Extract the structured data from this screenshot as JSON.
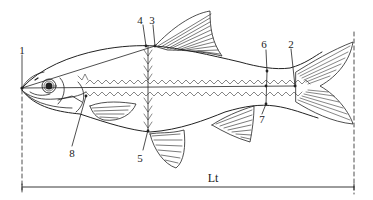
{
  "diagram": {
    "colors": {
      "stroke": "#222222",
      "background": "#ffffff"
    },
    "landmarks": [
      {
        "id": "1",
        "label": "1",
        "x": 22,
        "y": 50
      },
      {
        "id": "2",
        "label": "2",
        "x": 291,
        "y": 44
      },
      {
        "id": "3",
        "label": "3",
        "x": 151,
        "y": 20
      },
      {
        "id": "4",
        "label": "4",
        "x": 139,
        "y": 20
      },
      {
        "id": "5",
        "label": "5",
        "x": 140,
        "y": 158
      },
      {
        "id": "6",
        "label": "6",
        "x": 264,
        "y": 44
      },
      {
        "id": "7",
        "label": "7",
        "x": 262,
        "y": 119
      },
      {
        "id": "8",
        "label": "8",
        "x": 72,
        "y": 153
      }
    ],
    "measurement": {
      "label": "Lt",
      "x": 213,
      "y": 178
    }
  }
}
